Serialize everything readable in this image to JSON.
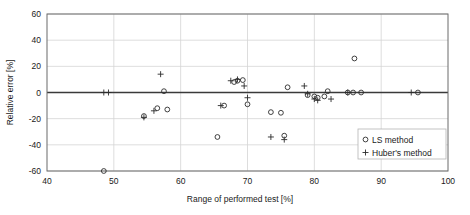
{
  "chart_data": {
    "type": "scatter",
    "title": "",
    "xlabel": "Range of performed test [%]",
    "ylabel": "Relative error [%]",
    "xlim": [
      40,
      100
    ],
    "ylim": [
      -60,
      60
    ],
    "xticks": [
      40,
      50,
      60,
      70,
      80,
      90,
      100
    ],
    "yticks": [
      60,
      40,
      20,
      0,
      -20,
      -40,
      -60
    ],
    "grid": true,
    "legend_position": "bottom-right",
    "series": [
      {
        "name": "LS method",
        "marker": "circle",
        "points": [
          [
            48.5,
            -60.0
          ],
          [
            54.5,
            -18.0
          ],
          [
            56.5,
            -12.0
          ],
          [
            57.5,
            1.0
          ],
          [
            58.0,
            -13.0
          ],
          [
            65.5,
            -34.0
          ],
          [
            66.5,
            -10.0
          ],
          [
            68.0,
            8.0
          ],
          [
            68.5,
            9.0
          ],
          [
            69.3,
            9.5
          ],
          [
            70.0,
            -9.0
          ],
          [
            73.5,
            -15.0
          ],
          [
            75.0,
            -15.5
          ],
          [
            75.5,
            -33.0
          ],
          [
            76.0,
            4.0
          ],
          [
            79.0,
            -2.0
          ],
          [
            80.0,
            -3.0
          ],
          [
            80.5,
            -4.0
          ],
          [
            81.5,
            -3.0
          ],
          [
            82.0,
            1.0
          ],
          [
            85.0,
            0.0
          ],
          [
            85.8,
            0.0
          ],
          [
            86.0,
            26.0
          ],
          [
            87.0,
            0.0
          ],
          [
            95.5,
            0.0
          ]
        ]
      },
      {
        "name": "Huber's method",
        "marker": "plus",
        "points": [
          [
            48.5,
            0.0
          ],
          [
            49.2,
            0.0
          ],
          [
            54.5,
            -19.0
          ],
          [
            56.0,
            -14.0
          ],
          [
            57.0,
            14.0
          ],
          [
            66.0,
            -10.0
          ],
          [
            67.5,
            9.0
          ],
          [
            68.5,
            10.0
          ],
          [
            69.5,
            5.0
          ],
          [
            70.0,
            -4.0
          ],
          [
            73.5,
            -34.0
          ],
          [
            75.5,
            -36.0
          ],
          [
            78.5,
            5.0
          ],
          [
            79.0,
            -1.0
          ],
          [
            80.0,
            -5.0
          ],
          [
            80.5,
            -6.0
          ],
          [
            82.5,
            -5.0
          ],
          [
            85.0,
            0.0
          ],
          [
            94.5,
            0.0
          ]
        ]
      }
    ]
  },
  "legend": {
    "entries": [
      {
        "label": "LS method",
        "marker": "circle"
      },
      {
        "label": "Huber's method",
        "marker": "plus"
      }
    ]
  },
  "colors": {
    "marker": "#2b2b2b",
    "grid": "#d4d4d4",
    "frame": "#6b6b6b",
    "zero_line": "#3a3a3a",
    "background": "#ffffff"
  }
}
